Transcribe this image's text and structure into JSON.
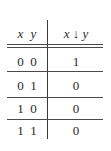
{
  "table": {
    "headers": {
      "inputs": [
        "x",
        "y"
      ],
      "output": "x ↓ y"
    },
    "rows": [
      {
        "x": "0",
        "y": "0",
        "result": "1"
      },
      {
        "x": "0",
        "y": "1",
        "result": "0"
      },
      {
        "x": "1",
        "y": "0",
        "result": "0"
      },
      {
        "x": "1",
        "y": "1",
        "result": "0"
      }
    ]
  }
}
